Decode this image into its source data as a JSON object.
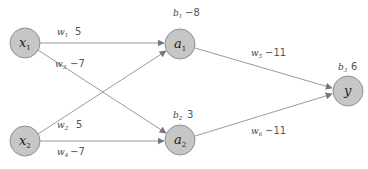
{
  "diagram": {
    "type": "neural-network",
    "colors": {
      "node_fill": "#c6c6c6",
      "node_stroke": "#8f8f8f",
      "edge": "#9a9a9a",
      "arrow": "#777777",
      "text": "#222222",
      "value_text": "#555555"
    },
    "nodes": [
      {
        "id": "x1",
        "symbol": "x",
        "subscript": "1",
        "layer": "input"
      },
      {
        "id": "x2",
        "symbol": "x",
        "subscript": "2",
        "layer": "input"
      },
      {
        "id": "a1",
        "symbol": "a",
        "subscript": "1",
        "layer": "hidden",
        "bias": {
          "symbol": "b",
          "subscript": "1",
          "value": "-8"
        }
      },
      {
        "id": "a2",
        "symbol": "a",
        "subscript": "2",
        "layer": "hidden",
        "bias": {
          "symbol": "b",
          "subscript": "2",
          "value": "3"
        }
      },
      {
        "id": "y",
        "symbol": "y",
        "subscript": "",
        "layer": "output",
        "bias": {
          "symbol": "b",
          "subscript": "3",
          "value": "6"
        }
      }
    ],
    "edges": [
      {
        "from": "x1",
        "to": "a1",
        "weight": {
          "symbol": "w",
          "subscript": "1",
          "value": "5"
        }
      },
      {
        "from": "x2",
        "to": "a1",
        "weight": {
          "symbol": "w",
          "subscript": "2",
          "value": "5"
        }
      },
      {
        "from": "x1",
        "to": "a2",
        "weight": {
          "symbol": "w",
          "subscript": "3",
          "value": "-7"
        }
      },
      {
        "from": "x2",
        "to": "a2",
        "weight": {
          "symbol": "w",
          "subscript": "4",
          "value": "-7"
        }
      },
      {
        "from": "a1",
        "to": "y",
        "weight": {
          "symbol": "w",
          "subscript": "5",
          "value": "-11"
        }
      },
      {
        "from": "a2",
        "to": "y",
        "weight": {
          "symbol": "w",
          "subscript": "6",
          "value": "-11"
        }
      }
    ]
  }
}
